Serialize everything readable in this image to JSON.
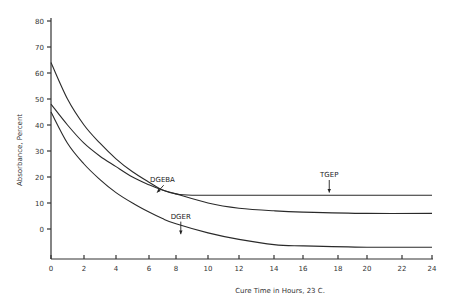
{
  "chart_data": {
    "type": "line",
    "title": "",
    "xlabel": "Cure Time in Hours, 23 C.",
    "ylabel": "Absorbance, Percent",
    "xlim": [
      0,
      24
    ],
    "ylim": [
      -11,
      80
    ],
    "x_ticks": [
      0,
      2,
      4,
      6,
      8,
      10,
      12,
      14,
      16,
      18,
      20,
      22,
      24
    ],
    "y_ticks": [
      0,
      10,
      20,
      30,
      40,
      50,
      60,
      70,
      80
    ],
    "grid": false,
    "legend": "none (curves labeled inline with arrows)",
    "series": [
      {
        "name": "TGEP",
        "x": [
          0,
          1,
          2,
          3,
          4,
          5,
          6,
          7,
          8,
          9,
          12,
          16,
          20,
          24
        ],
        "values": [
          64,
          50,
          40,
          33,
          27,
          22,
          18,
          15,
          13.5,
          13,
          13,
          13,
          13,
          13
        ]
      },
      {
        "name": "DGEBA",
        "x": [
          0,
          1,
          2,
          3,
          4,
          5,
          6,
          7,
          8,
          10,
          12,
          14,
          16,
          20,
          24
        ],
        "values": [
          48,
          40,
          33,
          28,
          24,
          20,
          17,
          15,
          13.5,
          10,
          8,
          7,
          6.5,
          6,
          6
        ]
      },
      {
        "name": "DGER",
        "x": [
          0,
          1,
          2,
          3,
          4,
          5,
          6,
          7,
          8,
          10,
          12,
          14,
          16,
          20,
          24
        ],
        "values": [
          45,
          33,
          25,
          19,
          14,
          10,
          6.5,
          4,
          2,
          -1.5,
          -4,
          -6,
          -6.5,
          -7,
          -7
        ]
      }
    ],
    "annotations": [
      {
        "text": "DGEBA",
        "x": 7,
        "y": 18,
        "arrow_to": [
          6.6,
          14
        ]
      },
      {
        "text": "TGEP",
        "x": 17.5,
        "y": 20,
        "arrow_to": [
          17.5,
          14
        ]
      },
      {
        "text": "DGER",
        "x": 8.3,
        "y": 4,
        "arrow_to": [
          8.3,
          -2
        ]
      }
    ]
  }
}
